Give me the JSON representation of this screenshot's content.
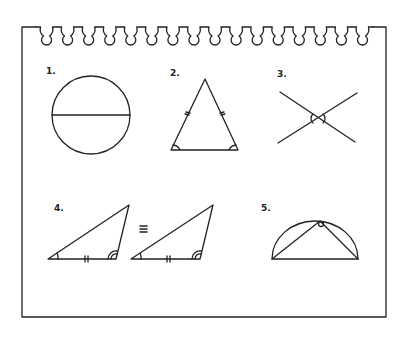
{
  "notepad": {
    "ring_count": 16,
    "stroke_color": "#222222",
    "background": "#ffffff"
  },
  "figures": [
    {
      "label": "1.",
      "description": "circle with diameter"
    },
    {
      "label": "2.",
      "description": "isosceles triangle with equal sides and equal base angles marked"
    },
    {
      "label": "3.",
      "description": "intersecting lines with vertical angles marked"
    },
    {
      "label": "4.",
      "description": "two congruent triangles",
      "symbol": "≡"
    },
    {
      "label": "5.",
      "description": "triangle inscribed in semicircle with right angle marked"
    }
  ]
}
